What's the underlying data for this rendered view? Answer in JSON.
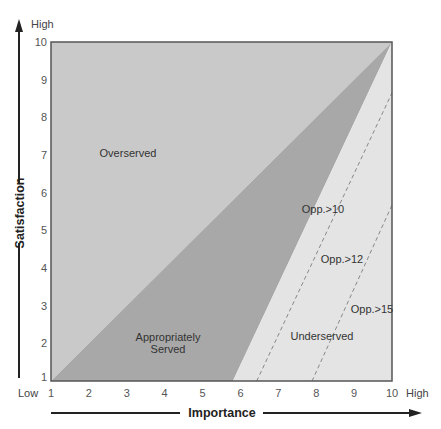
{
  "chart_data": {
    "type": "area",
    "title": "",
    "xlabel": "Importance",
    "ylabel": "Satisfaction",
    "xlim": [
      1,
      10
    ],
    "ylim": [
      1,
      10
    ],
    "x_ticks": [
      "1",
      "2",
      "3",
      "4",
      "5",
      "6",
      "7",
      "8",
      "9",
      "10"
    ],
    "y_ticks": [
      "1",
      "2",
      "3",
      "4",
      "5",
      "6",
      "7",
      "8",
      "9",
      "10"
    ],
    "x_low_label": "Low",
    "x_high_label": "High",
    "y_high_label": "High",
    "grid": false,
    "regions": [
      {
        "name": "Overserved",
        "label": "Overserved",
        "color": "#c9c9c9",
        "polygon": [
          [
            1,
            1
          ],
          [
            1,
            10
          ],
          [
            10,
            10
          ]
        ]
      },
      {
        "name": "Appropriately Served",
        "label_lines": [
          "Appropriately",
          "Served"
        ],
        "color": "#a8a8a8",
        "polygon": [
          [
            1,
            1
          ],
          [
            10,
            10
          ],
          [
            5.8,
            1
          ]
        ]
      },
      {
        "name": "Underserved",
        "label": "Underserved",
        "color": "#e4e4e4",
        "polygon": [
          [
            5.8,
            1
          ],
          [
            10,
            10
          ],
          [
            10,
            1
          ]
        ]
      }
    ],
    "threshold_lines": [
      {
        "label": "Opp.>10",
        "style": "dashed",
        "from": [
          10,
          10
        ],
        "to": [
          5.8,
          1
        ]
      },
      {
        "label": "Opp.>12",
        "style": "dashed",
        "from": [
          6.43,
          1
        ],
        "to": [
          10,
          8.65
        ]
      },
      {
        "label": "Opp.>15",
        "style": "dashed",
        "from": [
          7.89,
          1
        ],
        "to": [
          10,
          5.67
        ]
      }
    ],
    "annotations": [
      {
        "text": "Overserved",
        "x": 3.5,
        "y": 7.0
      },
      {
        "text": "Appropriately Served",
        "x": 4.5,
        "y": 1.8
      },
      {
        "text": "Underserved",
        "x": 8.0,
        "y": 1.9
      },
      {
        "text": "Opp.>10",
        "x": 7.6,
        "y": 5.6
      },
      {
        "text": "Opp.>12",
        "x": 8.6,
        "y": 4.3
      },
      {
        "text": "Opp.>15",
        "x": 9.6,
        "y": 2.9
      }
    ]
  },
  "labels": {
    "y_high": "High",
    "x_low": "Low",
    "x_high": "High",
    "x_axis_title": "Importance",
    "y_axis_title": "Satisfaction",
    "overserved": "Overserved",
    "appropriately_1": "Appropriately",
    "appropriately_2": "Served",
    "underserved": "Underserved",
    "opp10": "Opp.>10",
    "opp12": "Opp.>12",
    "opp15": "Opp.>15"
  },
  "colors": {
    "overserved": "#c9c9c9",
    "appropriately_served": "#a8a8a8",
    "underserved": "#e4e4e4",
    "frame": "#555555",
    "dashed": "#888888"
  }
}
